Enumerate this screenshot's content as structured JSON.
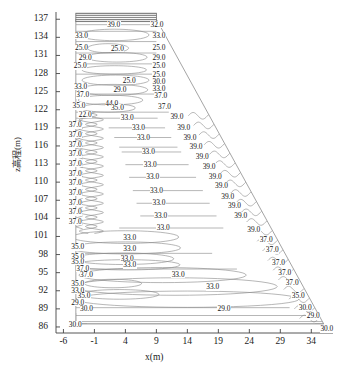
{
  "figure": {
    "kind": "contour-plot",
    "background": "#ffffff",
    "line_color": "#8a8a8a",
    "frame_color": "#9a9a9a",
    "text_color": "#1a1a1a",
    "hatch_band_color": "#8c8c8c"
  },
  "axes": {
    "x_label": "x(m)",
    "y_label": "z高程(m)",
    "x_ticks": [
      "-6",
      "-1",
      "4",
      "9",
      "14",
      "19",
      "24",
      "29",
      "34"
    ],
    "x_tick_values": [
      -6,
      -1,
      4,
      9,
      14,
      19,
      24,
      29,
      34
    ],
    "y_ticks": [
      "137",
      "134",
      "131",
      "128",
      "125",
      "122",
      "119",
      "116",
      "113",
      "110",
      "107",
      "104",
      "101",
      "98",
      "95",
      "92",
      "89",
      "86"
    ],
    "y_tick_values": [
      137,
      134,
      131,
      128,
      125,
      122,
      119,
      116,
      113,
      110,
      107,
      104,
      101,
      98,
      95,
      92,
      89,
      86
    ],
    "xlim": [
      -7.2,
      37.5
    ],
    "ylim": [
      85.0,
      138.2
    ],
    "grid": false
  },
  "chart_data": {
    "type": "line",
    "title": "",
    "xlabel": "x(m)",
    "ylabel": "z高程(m)",
    "xlim": [
      -7.2,
      37.5
    ],
    "ylim": [
      85.0,
      138.2
    ],
    "grid": false,
    "legend": "none",
    "contour_levels": [
      25.0,
      29.0,
      30.0,
      33.0,
      35.0,
      37.0,
      39.0,
      44.0
    ],
    "contour_label_format": "%.1f",
    "domain_note": "Trapezoidal embankment cross-section: vertical upstream face at x=-4, flat crest from x=-4 to x=9 at z=137, downstream slope from (9,137) to (36,86), horizontal base at z=86.5",
    "crest": {
      "x_left": -4,
      "x_right": 9,
      "z": 137
    },
    "toe": {
      "x": 36,
      "z": 86.5
    },
    "base_z": 86.5,
    "labels": [
      {
        "text": "39.0",
        "x": 1.0,
        "z": 136.1
      },
      {
        "text": "32.0",
        "x": 8.0,
        "z": 136.1
      },
      {
        "text": "33.0",
        "x": -4.2,
        "z": 134.3
      },
      {
        "text": "33.0",
        "x": 8.3,
        "z": 134.3
      },
      {
        "text": "25.0",
        "x": -4.2,
        "z": 132.3
      },
      {
        "text": "25.0",
        "x": 1.6,
        "z": 132.1
      },
      {
        "text": "25.0",
        "x": 8.3,
        "z": 132.3
      },
      {
        "text": "29.0",
        "x": -3.6,
        "z": 130.6
      },
      {
        "text": "29.0",
        "x": 8.3,
        "z": 130.6
      },
      {
        "text": "25.0",
        "x": -4.4,
        "z": 129.2
      },
      {
        "text": "25.0",
        "x": 8.3,
        "z": 129.2
      },
      {
        "text": "25.0",
        "x": 8.3,
        "z": 127.8
      },
      {
        "text": "25.0",
        "x": 3.5,
        "z": 126.8
      },
      {
        "text": "30.0",
        "x": 8.3,
        "z": 126.6
      },
      {
        "text": "33.0",
        "x": -4.3,
        "z": 125.8
      },
      {
        "text": "33.0",
        "x": 8.3,
        "z": 125.5
      },
      {
        "text": "29.0",
        "x": 2.0,
        "z": 125.3
      },
      {
        "text": "37.0",
        "x": -4.0,
        "z": 124.4
      },
      {
        "text": "37.0",
        "x": 8.6,
        "z": 124.2
      },
      {
        "text": "35.0",
        "x": -4.6,
        "z": 122.6
      },
      {
        "text": "44.0",
        "x": 0.7,
        "z": 122.9
      },
      {
        "text": "35.0",
        "x": 1.6,
        "z": 122.3
      },
      {
        "text": "37.0",
        "x": 9.2,
        "z": 122.5
      },
      {
        "text": "22.0",
        "x": -3.6,
        "z": 121.2
      },
      {
        "text": "33.0",
        "x": 3.2,
        "z": 120.6
      },
      {
        "text": "39.0",
        "x": 11.2,
        "z": 120.8
      },
      {
        "text": "37.0",
        "x": -5.2,
        "z": 119.4
      },
      {
        "text": "33.0",
        "x": 5.0,
        "z": 119.0
      },
      {
        "text": "39.0",
        "x": 12.3,
        "z": 119.0
      },
      {
        "text": "37.0",
        "x": -5.2,
        "z": 117.8
      },
      {
        "text": "33.0",
        "x": 5.8,
        "z": 117.4
      },
      {
        "text": "39.0",
        "x": 13.3,
        "z": 117.4
      },
      {
        "text": "37.0",
        "x": -5.2,
        "z": 116.2
      },
      {
        "text": "39.0",
        "x": 14.3,
        "z": 115.8
      },
      {
        "text": "37.0",
        "x": -5.2,
        "z": 114.6
      },
      {
        "text": "33.0",
        "x": 6.6,
        "z": 115.0
      },
      {
        "text": "39.0",
        "x": 15.3,
        "z": 114.2
      },
      {
        "text": "37.0",
        "x": -5.2,
        "z": 113.0
      },
      {
        "text": "33.0",
        "x": 6.9,
        "z": 112.9
      },
      {
        "text": "39.0",
        "x": 16.4,
        "z": 112.5
      },
      {
        "text": "37.0",
        "x": -5.2,
        "z": 111.4
      },
      {
        "text": "33.0",
        "x": 7.3,
        "z": 110.8
      },
      {
        "text": "39.0",
        "x": 17.4,
        "z": 110.9
      },
      {
        "text": "37.0",
        "x": -5.2,
        "z": 109.8
      },
      {
        "text": "39.0",
        "x": 18.4,
        "z": 109.3
      },
      {
        "text": "37.0",
        "x": -5.2,
        "z": 108.2
      },
      {
        "text": "33.0",
        "x": 7.9,
        "z": 108.6
      },
      {
        "text": "39.0",
        "x": 19.4,
        "z": 107.6
      },
      {
        "text": "37.0",
        "x": -5.2,
        "z": 106.6
      },
      {
        "text": "33.0",
        "x": 8.3,
        "z": 106.5
      },
      {
        "text": "39.0",
        "x": 20.5,
        "z": 106.0
      },
      {
        "text": "37.0",
        "x": -5.2,
        "z": 105.0
      },
      {
        "text": "33.0",
        "x": 8.6,
        "z": 104.4
      },
      {
        "text": "39.0",
        "x": 21.5,
        "z": 104.4
      },
      {
        "text": "37.0",
        "x": -5.2,
        "z": 103.4
      },
      {
        "text": "33.0",
        "x": 9.0,
        "z": 102.4
      },
      {
        "text": "39.0",
        "x": 23.6,
        "z": 102.0
      },
      {
        "text": "33.0",
        "x": 3.6,
        "z": 100.8
      },
      {
        "text": "37.0",
        "x": 25.6,
        "z": 100.4
      },
      {
        "text": "35.0",
        "x": -4.8,
        "z": 99.2
      },
      {
        "text": "33.0",
        "x": 3.6,
        "z": 99.0
      },
      {
        "text": "37.0",
        "x": 26.6,
        "z": 98.7
      },
      {
        "text": "35.0",
        "x": -4.8,
        "z": 97.6
      },
      {
        "text": "35.0",
        "x": -4.8,
        "z": 96.8
      },
      {
        "text": "33.0",
        "x": 3.2,
        "z": 97.2
      },
      {
        "text": "33.0",
        "x": 3.6,
        "z": 96.2
      },
      {
        "text": "37.0",
        "x": 27.6,
        "z": 96.6
      },
      {
        "text": "37.0",
        "x": -4.0,
        "z": 95.6
      },
      {
        "text": "37.0",
        "x": -3.4,
        "z": 94.6
      },
      {
        "text": "33.0",
        "x": 11.4,
        "z": 94.6
      },
      {
        "text": "37.0",
        "x": 28.6,
        "z": 95.0
      },
      {
        "text": "35.0",
        "x": -4.8,
        "z": 93.2
      },
      {
        "text": "37.0",
        "x": 29.8,
        "z": 93.3
      },
      {
        "text": "33.0",
        "x": -4.8,
        "z": 92.0
      },
      {
        "text": "33.0",
        "x": 17.0,
        "z": 92.6
      },
      {
        "text": "35.0",
        "x": -3.8,
        "z": 91.2
      },
      {
        "text": "35.0",
        "x": 30.8,
        "z": 91.2
      },
      {
        "text": "29.0",
        "x": -4.8,
        "z": 90.0
      },
      {
        "text": "30.0",
        "x": -3.4,
        "z": 89.0
      },
      {
        "text": "29.0",
        "x": 18.8,
        "z": 89.0
      },
      {
        "text": "30.0",
        "x": 31.9,
        "z": 89.2
      },
      {
        "text": "29.0",
        "x": 33.2,
        "z": 87.8
      },
      {
        "text": "30.0",
        "x": -5.2,
        "z": 86.4
      },
      {
        "text": "30.0",
        "x": 35.4,
        "z": 85.6
      }
    ]
  }
}
